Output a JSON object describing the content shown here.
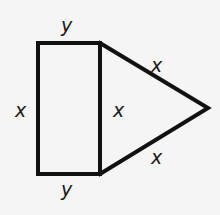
{
  "figure": {
    "shapes": [
      {
        "name": "rectangle",
        "sides": {
          "top": "y",
          "left": "x",
          "shared": "x",
          "bottom": "y"
        }
      },
      {
        "name": "triangle",
        "sides": {
          "shared": "x",
          "upper": "x",
          "lower": "x"
        }
      }
    ],
    "labels": {
      "top": "y",
      "left": "x",
      "shared": "x",
      "upper_right": "x",
      "lower_right": "x",
      "bottom": "y"
    },
    "colors": {
      "stroke": "#111111",
      "background": "#f5f5f5"
    }
  }
}
